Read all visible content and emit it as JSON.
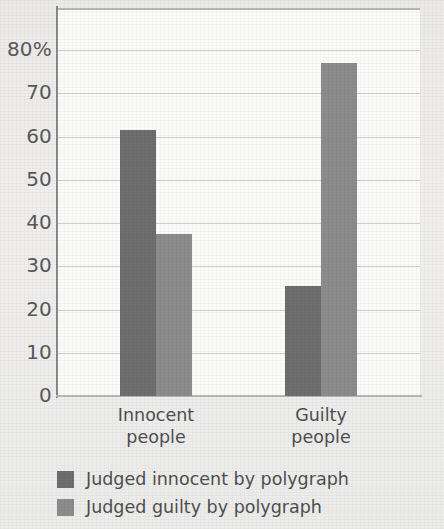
{
  "chart_data": {
    "type": "bar",
    "title": "",
    "subtitle": "",
    "xlabel": "",
    "ylabel": "",
    "ylim": [
      0,
      80
    ],
    "grid": true,
    "legend_position": "bottom-left",
    "categories": [
      "Innocent\npeople",
      "Guilty\npeople"
    ],
    "category_lines": [
      [
        "Innocent",
        "people"
      ],
      [
        "Guilty",
        "people"
      ]
    ],
    "y_ticks": [
      {
        "value": 80,
        "label": "80%"
      },
      {
        "value": 70,
        "label": "70"
      },
      {
        "value": 60,
        "label": "60"
      },
      {
        "value": 50,
        "label": "50"
      },
      {
        "value": 40,
        "label": "40"
      },
      {
        "value": 30,
        "label": "30"
      },
      {
        "value": 20,
        "label": "20"
      },
      {
        "value": 10,
        "label": "10"
      },
      {
        "value": 0,
        "label": "0"
      }
    ],
    "series": [
      {
        "name": "Judged innocent by polygraph",
        "color": "#6e6e6e",
        "values": [
          61.5,
          25.5
        ]
      },
      {
        "name": "Judged guilty by polygraph",
        "color": "#8c8c8c",
        "values": [
          37.5,
          77.0
        ]
      }
    ]
  },
  "legend": {
    "items": [
      {
        "label": "Judged innocent by polygraph",
        "color": "#6e6e6e"
      },
      {
        "label": "Judged guilty by polygraph",
        "color": "#8c8c8c"
      }
    ]
  },
  "colors": {
    "series_innocent": "#6e6e6e",
    "series_guilty": "#8c8c8c",
    "plot_background": "#fbfbfa",
    "page_background": "#eeedec",
    "grid": "#cfcfcd",
    "axis": "#8a8a88",
    "text": "#4f4f50"
  }
}
